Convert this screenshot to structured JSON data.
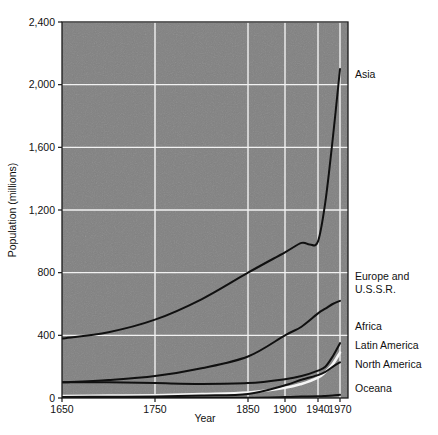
{
  "chart_data": {
    "type": "line",
    "title": "",
    "xlabel": "Year",
    "ylabel": "Population (millions)",
    "xlim": [
      1650,
      1970
    ],
    "ylim": [
      0,
      2400
    ],
    "grid": true,
    "legend_position": "right-inline",
    "x_ticks": [
      1650,
      1750,
      1850,
      1900,
      1940,
      1970
    ],
    "x_tick_labels": [
      "1650",
      "1750",
      "1850",
      "1900",
      "1940",
      "1970"
    ],
    "y_ticks": [
      0,
      400,
      800,
      1200,
      1600,
      2000,
      2400
    ],
    "y_tick_labels": [
      "0",
      "400",
      "800",
      "1,200",
      "1,600",
      "2,000",
      "2,400"
    ],
    "series": [
      {
        "name": "Asia",
        "label": "Asia",
        "label_lines": [
          "Asia"
        ],
        "x": [
          1650,
          1700,
          1750,
          1800,
          1850,
          1900,
          1920,
          1930,
          1940,
          1950,
          1960,
          1970
        ],
        "values": [
          380,
          420,
          500,
          630,
          800,
          930,
          990,
          980,
          1000,
          1250,
          1650,
          2100
        ]
      },
      {
        "name": "Europe and U.S.S.R.",
        "label": "Europe and U.S.S.R.",
        "label_lines": [
          "Europe and",
          "U.S.S.R."
        ],
        "x": [
          1650,
          1700,
          1750,
          1800,
          1850,
          1900,
          1920,
          1940,
          1950,
          1960,
          1970
        ],
        "values": [
          100,
          115,
          140,
          190,
          265,
          400,
          455,
          540,
          570,
          600,
          620
        ]
      },
      {
        "name": "Africa",
        "label": "Africa",
        "label_lines": [
          "Africa"
        ],
        "x": [
          1650,
          1700,
          1750,
          1800,
          1850,
          1900,
          1920,
          1940,
          1950,
          1960,
          1970
        ],
        "values": [
          100,
          100,
          95,
          90,
          95,
          120,
          140,
          175,
          200,
          265,
          350
        ]
      },
      {
        "name": "Latin America",
        "label": "Latin America",
        "label_lines": [
          "Latin America"
        ],
        "x": [
          1650,
          1700,
          1750,
          1800,
          1850,
          1900,
          1920,
          1940,
          1950,
          1960,
          1970
        ],
        "values": [
          12,
          15,
          18,
          25,
          35,
          65,
          90,
          130,
          165,
          215,
          290
        ]
      },
      {
        "name": "North America",
        "label": "North America",
        "label_lines": [
          "North America"
        ],
        "x": [
          1650,
          1700,
          1750,
          1800,
          1850,
          1900,
          1920,
          1940,
          1950,
          1960,
          1970
        ],
        "values": [
          6,
          8,
          10,
          16,
          26,
          81,
          117,
          146,
          166,
          199,
          228
        ]
      },
      {
        "name": "Oceana",
        "label": "Oceana",
        "label_lines": [
          "Oceana"
        ],
        "x": [
          1650,
          1700,
          1750,
          1800,
          1850,
          1900,
          1920,
          1940,
          1950,
          1960,
          1970
        ],
        "values": [
          2,
          2,
          2,
          2,
          2,
          6,
          9,
          11,
          13,
          16,
          20
        ]
      }
    ],
    "colors": {
      "plot_background": "#808080",
      "gridline": "#f2f2f2",
      "axis": "#1a1a1a",
      "curve_dark": "#101010",
      "curve_light": "#f5f5f5",
      "page_background": "#ffffff"
    }
  }
}
